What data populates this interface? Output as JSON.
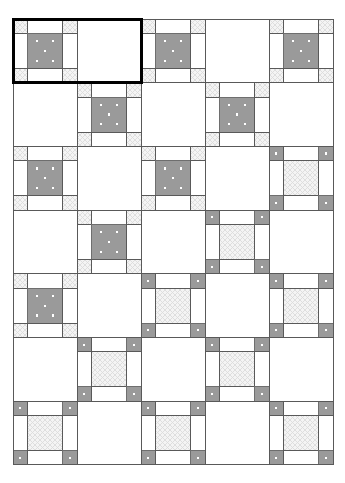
{
  "document": {
    "title": "Quilt Block Layout",
    "canvas_width": 345,
    "canvas_height": 483,
    "background_color": "#ffffff"
  },
  "grid": {
    "origin_x": 13,
    "origin_y": 19,
    "cell_width": 64,
    "cell_height": 63.7,
    "columns": 5,
    "rows": 7,
    "outline_color": "#595959",
    "outline_width": 1
  },
  "palette": {
    "block_gray": "#9a9a9a",
    "block_gray_edge": "#6e6e6e",
    "hatch_light": "#f0f0f0",
    "hatch_line": "#d8d8d8",
    "plain_white": "#ffffff",
    "seam_line": "#595959",
    "dot_color": "#ffffff",
    "selection_color": "#000000"
  },
  "block_types": {
    "A": {
      "name": "hatched-corner-block",
      "label": "Nine-patch: hatched corners, gray dotted center",
      "corner_fill": "hatch",
      "edge_fill": "white",
      "center_fill": "gray",
      "center_dots": 5,
      "corner_dots": 0
    },
    "B": {
      "name": "gray-corner-block",
      "label": "Nine-patch: gray dotted corners, hatched center",
      "corner_fill": "gray",
      "edge_fill": "white",
      "center_fill": "hatch",
      "center_dots": 0,
      "corner_dots": 1
    },
    "P": {
      "name": "plain-block",
      "label": "Plain white block",
      "corner_fill": "white",
      "edge_fill": "white",
      "center_fill": "white",
      "center_dots": 0,
      "corner_dots": 0
    }
  },
  "layout": {
    "rows": [
      [
        "A",
        "P",
        "A",
        "P",
        "A"
      ],
      [
        "P",
        "A",
        "P",
        "A",
        "P"
      ],
      [
        "A",
        "P",
        "A",
        "P",
        "B"
      ],
      [
        "P",
        "A",
        "P",
        "B",
        "P"
      ],
      [
        "A",
        "P",
        "B",
        "P",
        "B"
      ],
      [
        "P",
        "B",
        "P",
        "B",
        "P"
      ],
      [
        "B",
        "P",
        "B",
        "P",
        "B"
      ]
    ]
  },
  "selection": {
    "name": "selection-rectangle",
    "label": "Selected region",
    "start_col": 0,
    "start_row": 0,
    "span_cols": 2,
    "span_rows": 1,
    "stroke_color": "#000000",
    "stroke_width": 3
  }
}
